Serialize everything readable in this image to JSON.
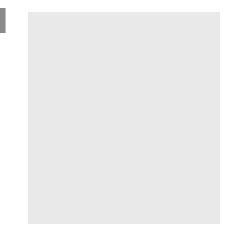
{
  "app": {
    "title": "Go Board Diagram",
    "board_background_color": "#e9e9e9",
    "page_background_color": "#ffffff",
    "grid_line_color": "#8d8d8d",
    "black_stone_color": "#0b0b0b",
    "white_stone_color": "#fbfbfb"
  },
  "edge_marker": {
    "name": "left-edge-marker",
    "color": "#8a8a8a"
  },
  "board": {
    "cols": 9,
    "rows": 10,
    "cell": 22,
    "origin_x": 5,
    "origin_y": 9,
    "star_points": [
      {
        "col": 3,
        "row": 0
      },
      {
        "col": 8,
        "row": 0
      }
    ],
    "edges": {
      "left": true,
      "right": true,
      "bottom": true,
      "top": false
    },
    "stones": [
      {
        "col": 2,
        "row": 5,
        "color": "black",
        "label": ""
      },
      {
        "col": 3,
        "row": 5,
        "color": "black",
        "label": ""
      },
      {
        "col": 0,
        "row": 6,
        "color": "black",
        "label": ""
      },
      {
        "col": 2,
        "row": 6,
        "color": "white",
        "label": ""
      },
      {
        "col": 3,
        "row": 6,
        "color": "black",
        "label": ""
      },
      {
        "col": 4,
        "row": 6,
        "color": "black",
        "label": ""
      },
      {
        "col": 5,
        "row": 6,
        "color": "black",
        "label": ""
      },
      {
        "col": 6,
        "row": 6,
        "color": "black",
        "label": ""
      },
      {
        "col": 7,
        "row": 6,
        "color": "black",
        "label": ""
      },
      {
        "col": 8,
        "row": 6,
        "color": "black",
        "label": ""
      },
      {
        "col": 0,
        "row": 7,
        "color": "black",
        "label": ""
      },
      {
        "col": 1,
        "row": 7,
        "color": "white",
        "label": ""
      },
      {
        "col": 2,
        "row": 7,
        "color": "black",
        "label": "11"
      },
      {
        "col": 3,
        "row": 7,
        "color": "white",
        "label": ""
      },
      {
        "col": 4,
        "row": 7,
        "color": "white",
        "label": ""
      },
      {
        "col": 5,
        "row": 7,
        "color": "white",
        "label": ""
      },
      {
        "col": 6,
        "row": 7,
        "color": "white",
        "label": ""
      },
      {
        "col": 7,
        "row": 7,
        "color": "white",
        "label": ""
      },
      {
        "col": 8,
        "row": 7,
        "color": "black",
        "label": ""
      },
      {
        "col": 0,
        "row": 8,
        "color": "black",
        "label": ""
      },
      {
        "col": 1,
        "row": 8,
        "color": "white",
        "label": ""
      },
      {
        "col": 3,
        "row": 8,
        "color": "white",
        "label": "10"
      },
      {
        "col": 4,
        "row": 8,
        "color": "black",
        "label": "9"
      },
      {
        "col": 6,
        "row": 8,
        "color": "white",
        "label": ""
      },
      {
        "col": 7,
        "row": 8,
        "color": "white",
        "label": ""
      },
      {
        "col": 8,
        "row": 8,
        "color": "black",
        "label": ""
      },
      {
        "col": 0,
        "row": 9,
        "color": "black",
        "label": ""
      },
      {
        "col": 1,
        "row": 9,
        "color": "black",
        "label": ""
      },
      {
        "col": 2,
        "row": 9,
        "color": "white",
        "label": ""
      },
      {
        "col": 3,
        "row": 9,
        "color": "white",
        "label": ""
      },
      {
        "col": 4,
        "row": 9,
        "color": "white",
        "label": ""
      },
      {
        "col": 5,
        "row": 9,
        "color": "white",
        "label": ""
      },
      {
        "col": 6,
        "row": 9,
        "color": "white",
        "label": ""
      },
      {
        "col": 7,
        "row": 9,
        "color": "white",
        "label": ""
      }
    ],
    "move_labels": [
      "9",
      "10",
      "11"
    ]
  }
}
